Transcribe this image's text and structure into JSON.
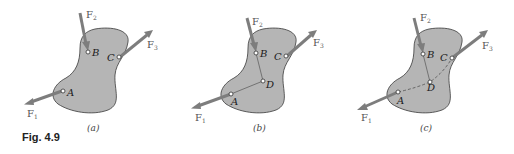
{
  "figure": {
    "caption": "Fig. 4.9",
    "fill_color": "#b5b5b5",
    "arrow_color": "#7d7d7d",
    "panels": [
      {
        "id": "a",
        "label": "(a)",
        "points": {
          "A": "A",
          "B": "B",
          "C": "C"
        },
        "forces": {
          "F1": "F",
          "F1_sub": "1",
          "F2": "F",
          "F2_sub": "2",
          "F3": "F",
          "F3_sub": "3"
        }
      },
      {
        "id": "b",
        "label": "(b)",
        "points": {
          "A": "A",
          "B": "B",
          "C": "C",
          "D": "D"
        },
        "forces": {
          "F1": "F",
          "F1_sub": "1",
          "F2": "F",
          "F2_sub": "2",
          "F3": "F",
          "F3_sub": "3"
        }
      },
      {
        "id": "c",
        "label": "(c)",
        "points": {
          "A": "A",
          "B": "B",
          "C": "C",
          "D": "D"
        },
        "forces": {
          "F1": "F",
          "F1_sub": "1",
          "F2": "F",
          "F2_sub": "2",
          "F3": "F",
          "F3_sub": "3"
        }
      }
    ]
  }
}
